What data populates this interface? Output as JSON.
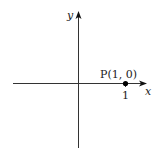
{
  "diagram": {
    "type": "coordinate-plane",
    "axes": {
      "x_label": "x",
      "y_label": "y"
    },
    "point": {
      "name": "P",
      "label": "P(1, 0)",
      "coords": [
        1,
        0
      ]
    },
    "ticks": {
      "x": [
        "1"
      ]
    },
    "colors": {
      "axis": "#333333",
      "point": "#000000",
      "background": "#ffffff"
    }
  }
}
